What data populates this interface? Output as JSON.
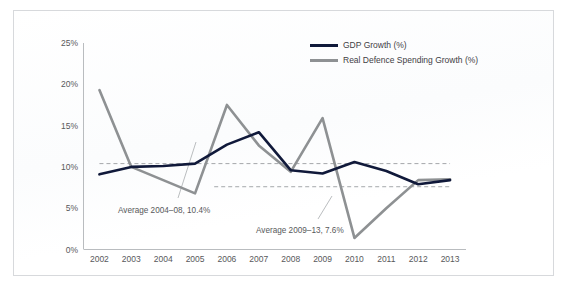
{
  "figure": {
    "caption_fragment": "",
    "background": "#ffffff",
    "border_color": "#d7d9dc"
  },
  "legend": {
    "position": "top-right",
    "items": [
      {
        "name": "gdp-growth",
        "label": "GDP Growth (%)",
        "color": "#10193a"
      },
      {
        "name": "real-defence-spending-growth",
        "label": "Real Defence Spending Growth (%)",
        "color": "#8e9193"
      }
    ]
  },
  "annotations": [
    {
      "name": "average-2004-08",
      "text": "Average 2004–08, 10.4%",
      "value": 10.4,
      "period": "2004–08",
      "x": 118,
      "y": 206
    },
    {
      "name": "average-2009-13",
      "text": "Average 2009–13, 7.6%",
      "value": 7.6,
      "period": "2009–13",
      "x": 256,
      "y": 226
    }
  ],
  "chart_data": {
    "type": "line",
    "title": "",
    "xlabel": "",
    "ylabel": "",
    "x": [
      2002,
      2003,
      2004,
      2005,
      2006,
      2007,
      2008,
      2009,
      2010,
      2011,
      2012,
      2013
    ],
    "categories": [
      "2002",
      "2003",
      "2004",
      "2005",
      "2006",
      "2007",
      "2008",
      "2009",
      "2010",
      "2011",
      "2012",
      "2013"
    ],
    "ylim": [
      0,
      25
    ],
    "yticks": [
      0,
      5,
      10,
      15,
      20,
      25
    ],
    "yticklabels": [
      "0%",
      "5%",
      "10%",
      "15%",
      "20%",
      "25%"
    ],
    "grid": false,
    "legend_position": "top-right",
    "series": [
      {
        "name": "GDP Growth (%)",
        "color": "#10193a",
        "width": 2.6,
        "values": [
          9.1,
          10.0,
          10.1,
          10.4,
          12.7,
          14.2,
          9.6,
          9.2,
          10.6,
          9.5,
          7.9,
          8.4
        ]
      },
      {
        "name": "Real Defence Spending Growth (%)",
        "color": "#8e9193",
        "width": 2.6,
        "values": [
          19.3,
          10.0,
          8.4,
          6.8,
          17.5,
          12.6,
          9.4,
          15.9,
          1.4,
          5.0,
          8.4,
          8.5
        ]
      }
    ],
    "reference_lines": [
      {
        "name": "average-2004-08-line",
        "value": 10.4,
        "label": "Average 2004–08, 10.4%",
        "style": "dashed",
        "color": "#9a9da0",
        "x_start": 2002,
        "x_end": 2013
      },
      {
        "name": "average-2009-13-line",
        "value": 7.6,
        "label": "Average 2009–13, 7.6%",
        "style": "dashed",
        "color": "#9a9da0",
        "x_start": 2005.6,
        "x_end": 2013
      }
    ]
  }
}
